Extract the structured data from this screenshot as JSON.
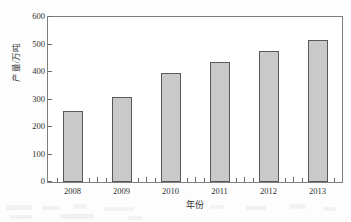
{
  "chart_data": {
    "type": "bar",
    "title": "",
    "xlabel": "年份",
    "ylabel": "产量/万吨",
    "categories": [
      "2008",
      "2009",
      "2010",
      "2011",
      "2012",
      "2013"
    ],
    "values": [
      260,
      310,
      398,
      437,
      477,
      516
    ],
    "ylim": [
      0,
      600
    ],
    "ytick_values": [
      0,
      100,
      200,
      300,
      400,
      500,
      600
    ],
    "ytick_labels": [
      "0",
      "100",
      "200",
      "300",
      "400",
      "500",
      "600"
    ],
    "grid": false,
    "legend": null,
    "series": [
      {
        "name": "产量",
        "values": [
          260,
          310,
          398,
          437,
          477,
          516
        ],
        "color": "#c9c9c9",
        "edge_color": "#585858"
      }
    ],
    "bar_color": "#c9c9c9",
    "bar_edge_color": "#585858",
    "axis_color": "#7e7e7e",
    "background_color": "#ffffff"
  }
}
